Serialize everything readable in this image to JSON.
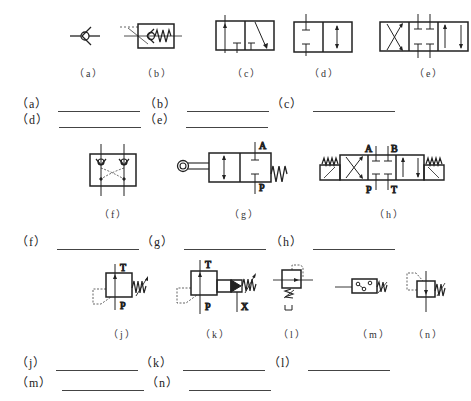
{
  "figures": [
    {
      "id": "a",
      "caption": "（a）",
      "symbol": "check-valve"
    },
    {
      "id": "b",
      "caption": "（b）",
      "symbol": "spring-check-valve"
    },
    {
      "id": "c",
      "caption": "（c）",
      "symbol": "2-position-valve"
    },
    {
      "id": "d",
      "caption": "（d）",
      "symbol": "2-position-2-way-valve"
    },
    {
      "id": "e",
      "caption": "（e）",
      "symbol": "3-position-4-way-valve"
    },
    {
      "id": "f",
      "caption": "（f）",
      "symbol": "dual-pilot-check-valve"
    },
    {
      "id": "g",
      "caption": "（g）",
      "symbol": "roller-operated-2-way-valve",
      "ports": {
        "top": "A",
        "bottom": "P"
      }
    },
    {
      "id": "h",
      "caption": "（h）",
      "symbol": "3-position-4-way-solenoid-valve",
      "ports": {
        "a": "A",
        "b": "B",
        "p": "P",
        "t": "T"
      }
    },
    {
      "id": "j",
      "caption": "（j）",
      "symbol": "relief-valve",
      "ports": {
        "top": "T",
        "bottom": "P"
      }
    },
    {
      "id": "k",
      "caption": "（k）",
      "symbol": "pilot-relief-valve",
      "ports": {
        "top": "T",
        "bottom": "P",
        "x": "X"
      }
    },
    {
      "id": "l",
      "caption": "（l）",
      "symbol": "pressure-reducing-valve"
    },
    {
      "id": "m",
      "caption": "（m）",
      "symbol": "pressure-switch"
    },
    {
      "id": "n",
      "caption": "（n）",
      "symbol": "sequence-valve"
    }
  ],
  "answers": [
    {
      "label": "（a）",
      "value": ""
    },
    {
      "label": "（b）",
      "value": ""
    },
    {
      "label": "（c）",
      "value": ""
    },
    {
      "label": "（d）",
      "value": ""
    },
    {
      "label": "（e）",
      "value": ""
    },
    {
      "label": "（f）",
      "value": ""
    },
    {
      "label": "（g）",
      "value": ""
    },
    {
      "label": "（h）",
      "value": ""
    },
    {
      "label": "（j）",
      "value": ""
    },
    {
      "label": "（k）",
      "value": ""
    },
    {
      "label": "（l）",
      "value": ""
    },
    {
      "label": "（m）",
      "value": ""
    },
    {
      "label": "（n）",
      "value": ""
    }
  ]
}
